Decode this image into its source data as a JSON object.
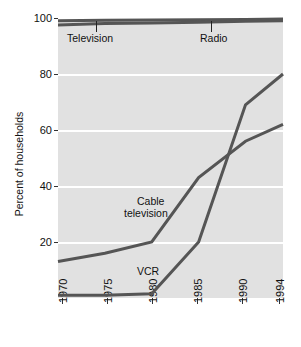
{
  "chart_data": {
    "type": "line",
    "title": "",
    "subtitle": "",
    "xlabel": "",
    "ylabel": "Percent of households",
    "xlim": [
      1970,
      1994
    ],
    "ylim": [
      0,
      100
    ],
    "grid": true,
    "grid_orientation": "horizontal",
    "legend_position": "inline-annotations",
    "xtick_labels": [
      "1970",
      "1975",
      "1980",
      "1985",
      "1990",
      "1994"
    ],
    "xtick_values": [
      1970,
      1975,
      1980,
      1985,
      1990,
      1994
    ],
    "ytick_labels": [
      "20",
      "40",
      "60",
      "80",
      "100"
    ],
    "ytick_values": [
      20,
      40,
      60,
      80,
      100
    ],
    "line_color": "#555555",
    "plot_background": "#e1e1e1",
    "gridline_color": "#ffffff",
    "series": [
      {
        "name": "Television",
        "label": "Television",
        "x": [
          1970,
          1975,
          1980,
          1985,
          1990,
          1994
        ],
        "values": [
          97.5,
          98.0,
          98.2,
          98.5,
          98.8,
          99.0
        ]
      },
      {
        "name": "Radio",
        "label": "Radio",
        "x": [
          1970,
          1975,
          1980,
          1985,
          1990,
          1994
        ],
        "values": [
          99.0,
          99.2,
          99.3,
          99.4,
          99.5,
          99.6
        ]
      },
      {
        "name": "Cable television",
        "label": "Cable television",
        "x": [
          1970,
          1975,
          1980,
          1985,
          1990,
          1994
        ],
        "values": [
          13,
          16,
          20,
          43,
          56,
          62
        ]
      },
      {
        "name": "VCR",
        "label": "VCR",
        "x": [
          1970,
          1975,
          1980,
          1985,
          1990,
          1994
        ],
        "values": [
          1,
          1,
          1.5,
          20,
          69,
          80
        ]
      }
    ],
    "annotations": [
      {
        "text": "Television",
        "series": "Television"
      },
      {
        "text": "Radio",
        "series": "Radio"
      },
      {
        "text": "Cable",
        "series": "Cable television"
      },
      {
        "text": "television",
        "series": "Cable television"
      },
      {
        "text": "VCR",
        "series": "VCR"
      }
    ]
  },
  "labels": {
    "ylabel": "Percent of households",
    "television": "Television",
    "radio": "Radio",
    "cable_line1": "Cable",
    "cable_line2": "television",
    "vcr": "VCR"
  },
  "yticks": [
    "100",
    "80",
    "60",
    "40",
    "20"
  ],
  "xticks": [
    "1970",
    "1975",
    "1980",
    "1985",
    "1990",
    "1994"
  ]
}
